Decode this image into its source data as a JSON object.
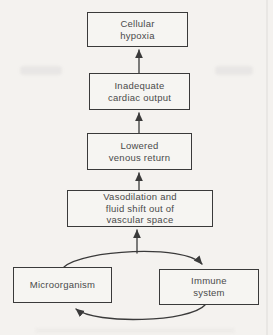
{
  "diagram": {
    "type": "flowchart",
    "nodes": [
      {
        "id": "cellular-hypoxia",
        "label": "Cellular\nhypoxia"
      },
      {
        "id": "inadequate-cardiac-output",
        "label": "Inadequate\ncardiac output"
      },
      {
        "id": "lowered-venous-return",
        "label": "Lowered\nvenous return"
      },
      {
        "id": "vasodilation-fluid-shift",
        "label": "Vasodilation and\nfluid shift out of\nvascular space"
      },
      {
        "id": "microorganism",
        "label": "Microorganism"
      },
      {
        "id": "immune-system",
        "label": "Immune\nsystem"
      }
    ],
    "edges": [
      {
        "from": "microorganism",
        "to": "immune-system",
        "style": "curved-cycle-top"
      },
      {
        "from": "immune-system",
        "to": "microorganism",
        "style": "curved-cycle-bottom"
      },
      {
        "from": "microorganism-immune-cycle",
        "to": "vasodilation-fluid-shift",
        "style": "straight-up"
      },
      {
        "from": "vasodilation-fluid-shift",
        "to": "lowered-venous-return",
        "style": "straight-up"
      },
      {
        "from": "lowered-venous-return",
        "to": "inadequate-cardiac-output",
        "style": "straight-up"
      },
      {
        "from": "inadequate-cardiac-output",
        "to": "cellular-hypoxia",
        "style": "straight-up"
      }
    ]
  },
  "colors": {
    "background": "#f4f2ef",
    "box_fill": "#f6f5f2",
    "line": "#3a3a3a",
    "text": "#4a4a4a"
  }
}
